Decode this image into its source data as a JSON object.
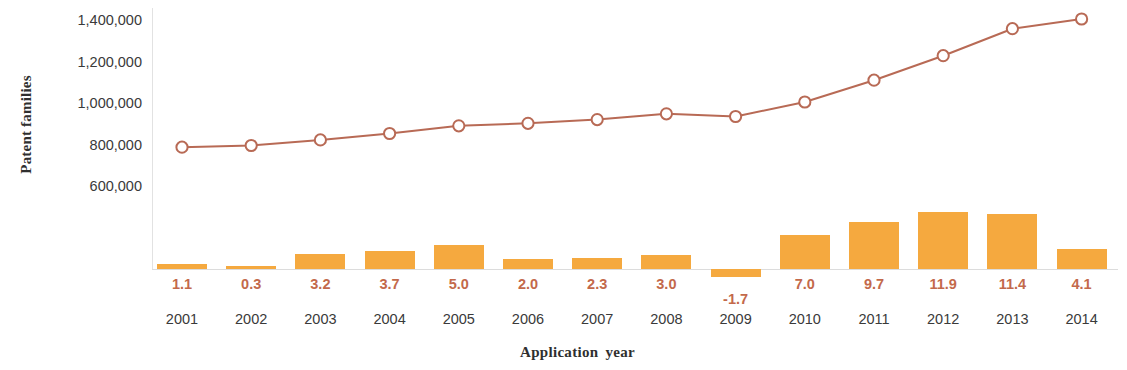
{
  "chart_data": {
    "type": "line",
    "title": "",
    "xlabel": "Application year",
    "ylabel": "Patent families",
    "categories": [
      "2001",
      "2002",
      "2003",
      "2004",
      "2005",
      "2006",
      "2007",
      "2008",
      "2009",
      "2010",
      "2011",
      "2012",
      "2013",
      "2014"
    ],
    "ylim": [
      0,
      1500000
    ],
    "yticks": [
      600000,
      800000,
      1000000,
      1200000,
      1400000
    ],
    "ytick_labels": [
      "600,000",
      "800,000",
      "1,000,000",
      "1,200,000",
      "1,400,000"
    ],
    "grid": false,
    "legend": "none",
    "series": [
      {
        "name": "Patent families",
        "type": "line",
        "marker": "open-circle",
        "color": "#b86a55",
        "values": [
          787000,
          795000,
          822000,
          853000,
          890000,
          902000,
          920000,
          948000,
          935000,
          1005000,
          1110000,
          1228000,
          1358000,
          1405000
        ]
      },
      {
        "name": "Growth rate",
        "type": "bar",
        "color": "#f5a93f",
        "unit": "%",
        "values": [
          1.1,
          0.3,
          3.2,
          3.7,
          5.0,
          2.0,
          2.3,
          3.0,
          -1.7,
          7.0,
          9.7,
          11.9,
          11.4,
          4.1
        ]
      }
    ],
    "bar_labels": [
      "1.1",
      "0.3",
      "3.2",
      "3.7",
      "5.0",
      "2.0",
      "2.3",
      "3.0",
      "-1.7",
      "7.0",
      "9.7",
      "11.9",
      "11.4",
      "4.1"
    ]
  },
  "colors": {
    "bar": "#f5a93f",
    "line": "#b86a55",
    "data_label": "#c3694b",
    "axis_text": "#3a3a3a",
    "axis_line": "#dcdcdc"
  }
}
